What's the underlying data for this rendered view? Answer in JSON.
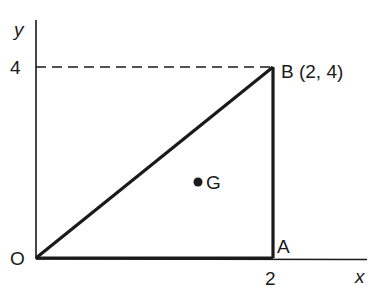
{
  "diagram": {
    "type": "coordinate-geometry-triangle",
    "axes": {
      "x_label": "x",
      "y_label": "y",
      "x_tick": "2",
      "y_tick": "4"
    },
    "points": {
      "origin": {
        "label": "O",
        "coords": [
          0,
          0
        ]
      },
      "A": {
        "label": "A",
        "coords": [
          2,
          0
        ]
      },
      "B": {
        "label": "B (2, 4)",
        "coords": [
          2,
          4
        ]
      },
      "G": {
        "label": "G"
      }
    },
    "triangle": [
      "O",
      "A",
      "B"
    ],
    "dashed_guide": "horizontal line from y-axis at 4 to B",
    "colors": {
      "ink": "#1a1a1a",
      "background": "#ffffff"
    }
  }
}
